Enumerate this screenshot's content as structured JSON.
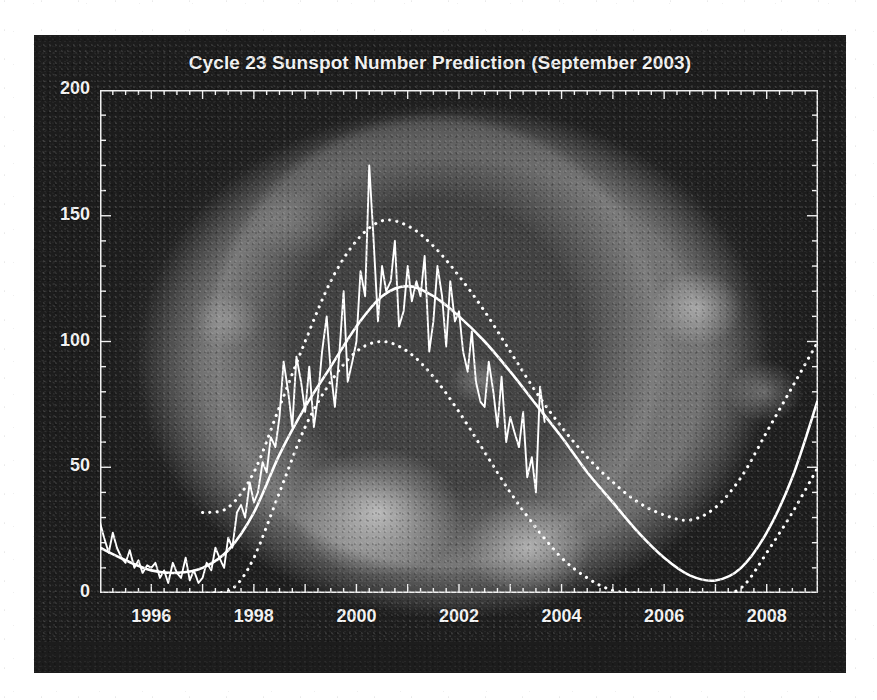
{
  "chart_data": {
    "type": "line",
    "title": "Cycle 23 Sunspot Number Prediction (September 2003)",
    "xlabel": "",
    "ylabel": "",
    "xlim": [
      1995.0,
      2009.0
    ],
    "ylim": [
      0,
      200
    ],
    "grid": false,
    "legend_position": "none",
    "x_ticks": [
      1996,
      1998,
      2000,
      2002,
      2004,
      2006,
      2008
    ],
    "x_tick_labels": [
      "1996",
      "1998",
      "2000",
      "2002",
      "2004",
      "2006",
      "2008"
    ],
    "x_minor_tick_interval": 0.25,
    "y_ticks": [
      0,
      50,
      100,
      150,
      200
    ],
    "y_tick_labels": [
      "0",
      "50",
      "100",
      "150",
      "200"
    ],
    "y_minor_tick_interval": 10,
    "background_image": "solar-corona-photograph",
    "series": [
      {
        "name": "Observed monthly sunspot number",
        "style": "solid-noisy",
        "color": "#ffffff",
        "x": [
          1995.0,
          1995.08,
          1995.17,
          1995.25,
          1995.33,
          1995.42,
          1995.5,
          1995.58,
          1995.67,
          1995.75,
          1995.83,
          1995.92,
          1996.0,
          1996.08,
          1996.17,
          1996.25,
          1996.33,
          1996.42,
          1996.5,
          1996.58,
          1996.67,
          1996.75,
          1996.83,
          1996.92,
          1997.0,
          1997.08,
          1997.17,
          1997.25,
          1997.33,
          1997.42,
          1997.5,
          1997.58,
          1997.67,
          1997.75,
          1997.83,
          1997.92,
          1998.0,
          1998.08,
          1998.17,
          1998.25,
          1998.33,
          1998.42,
          1998.5,
          1998.58,
          1998.67,
          1998.75,
          1998.83,
          1998.92,
          1999.0,
          1999.08,
          1999.17,
          1999.25,
          1999.33,
          1999.42,
          1999.5,
          1999.58,
          1999.67,
          1999.75,
          1999.83,
          1999.92,
          2000.0,
          2000.08,
          2000.17,
          2000.25,
          2000.33,
          2000.42,
          2000.5,
          2000.58,
          2000.67,
          2000.75,
          2000.83,
          2000.92,
          2001.0,
          2001.08,
          2001.17,
          2001.25,
          2001.33,
          2001.42,
          2001.5,
          2001.58,
          2001.67,
          2001.75,
          2001.83,
          2001.92,
          2002.0,
          2002.08,
          2002.17,
          2002.25,
          2002.33,
          2002.42,
          2002.5,
          2002.58,
          2002.67,
          2002.75,
          2002.83,
          2002.92,
          2003.0,
          2003.08,
          2003.17,
          2003.25,
          2003.33,
          2003.42,
          2003.5,
          2003.58,
          2003.67
        ],
        "values": [
          28,
          22,
          16,
          24,
          18,
          14,
          12,
          17,
          10,
          13,
          8,
          11,
          10,
          12,
          6,
          9,
          4,
          12,
          8,
          6,
          14,
          5,
          9,
          4,
          6,
          12,
          9,
          18,
          14,
          10,
          22,
          18,
          32,
          35,
          30,
          44,
          36,
          40,
          52,
          48,
          62,
          58,
          70,
          92,
          80,
          66,
          94,
          84,
          72,
          90,
          66,
          78,
          96,
          110,
          88,
          74,
          96,
          120,
          84,
          92,
          100,
          128,
          118,
          170,
          142,
          108,
          130,
          120,
          124,
          140,
          106,
          112,
          130,
          116,
          124,
          118,
          134,
          96,
          108,
          130,
          118,
          98,
          124,
          108,
          112,
          96,
          88,
          104,
          84,
          76,
          74,
          92,
          80,
          66,
          86,
          60,
          70,
          64,
          58,
          72,
          46,
          54,
          40,
          82,
          68
        ]
      },
      {
        "name": "Smoothed / predicted sunspot number",
        "style": "solid-smooth",
        "color": "#ffffff",
        "x": [
          1995.0,
          1995.5,
          1996.0,
          1996.5,
          1997.0,
          1997.5,
          1998.0,
          1998.5,
          1999.0,
          1999.5,
          2000.0,
          2000.5,
          2001.0,
          2001.5,
          2002.0,
          2002.5,
          2003.0,
          2003.5,
          2004.0,
          2004.5,
          2005.0,
          2005.5,
          2006.0,
          2006.5,
          2007.0,
          2007.5,
          2008.0,
          2008.5,
          2009.0
        ],
        "values": [
          18,
          13,
          9,
          8,
          10,
          17,
          32,
          55,
          74,
          90,
          106,
          118,
          122,
          118,
          110,
          100,
          88,
          75,
          62,
          48,
          36,
          24,
          14,
          7,
          5,
          10,
          24,
          46,
          77
        ]
      },
      {
        "name": "Upper prediction bound (+1 sigma)",
        "style": "dotted",
        "color": "#ffffff",
        "x": [
          1997.0,
          1997.5,
          1998.0,
          1998.5,
          1999.0,
          1999.5,
          2000.0,
          2000.5,
          2001.0,
          2001.5,
          2002.0,
          2002.5,
          2003.0,
          2003.5,
          2004.0,
          2004.5,
          2005.0,
          2005.5,
          2006.0,
          2006.5,
          2007.0,
          2007.5,
          2008.0,
          2008.5,
          2009.0
        ],
        "values": [
          32,
          34,
          48,
          74,
          100,
          124,
          140,
          148,
          146,
          138,
          126,
          112,
          96,
          80,
          66,
          54,
          44,
          36,
          31,
          29,
          34,
          46,
          64,
          82,
          100
        ]
      },
      {
        "name": "Lower prediction bound (-1 sigma)",
        "style": "dotted",
        "color": "#ffffff",
        "x": [
          1996.8,
          1997.2,
          1997.6,
          1998.0,
          1998.5,
          1999.0,
          1999.5,
          2000.0,
          2000.5,
          2001.0,
          2001.5,
          2002.0,
          2002.5,
          2003.0,
          2003.5,
          2004.0,
          2004.5,
          2005.0,
          2005.5,
          2006.0,
          2006.5,
          2007.0,
          2007.3,
          2007.6,
          2008.0,
          2008.5,
          2009.0
        ],
        "values": [
          0,
          0,
          2,
          14,
          40,
          66,
          84,
          96,
          100,
          96,
          86,
          72,
          56,
          40,
          26,
          14,
          6,
          1,
          0,
          0,
          0,
          0,
          0,
          4,
          16,
          32,
          50
        ]
      }
    ],
    "annotations": {
      "observed_peak_value": 170,
      "observed_peak_year": 2000.25,
      "smoothed_peak_value": 122,
      "smoothed_peak_year": 2001.0,
      "smoothed_minimum_value": 5,
      "smoothed_minimum_year": 2007.0,
      "observed_data_end_year": 2003.67
    }
  }
}
